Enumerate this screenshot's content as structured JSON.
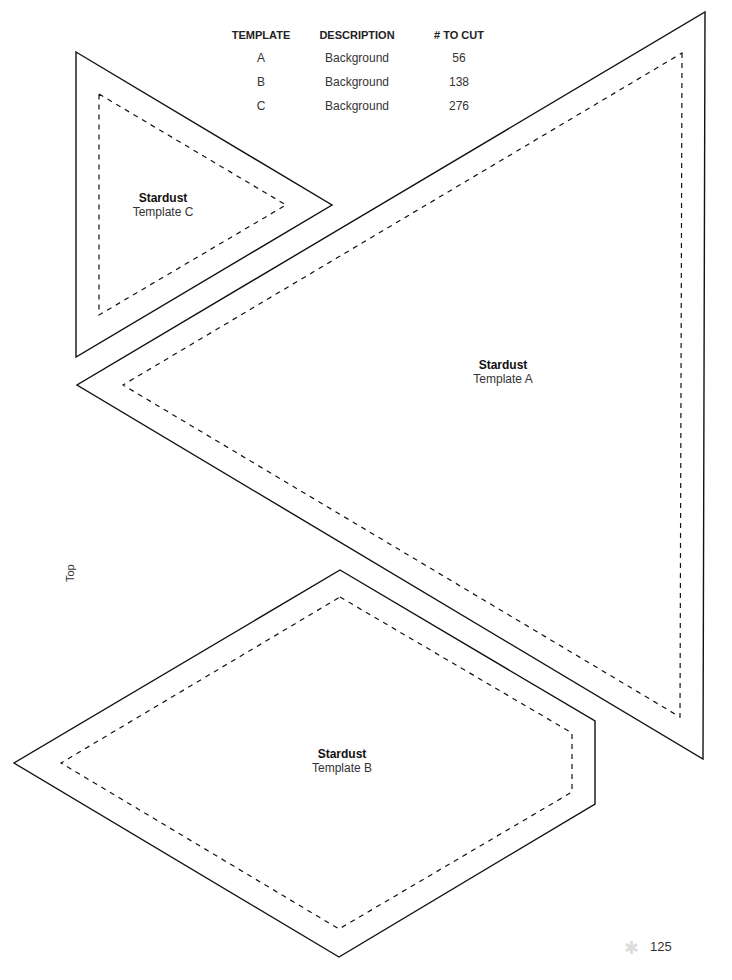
{
  "table": {
    "headers": [
      "TEMPLATE",
      "DESCRIPTION",
      "# TO CUT"
    ],
    "rows": [
      {
        "template": "A",
        "description": "Background",
        "count": "56"
      },
      {
        "template": "B",
        "description": "Background",
        "count": "138"
      },
      {
        "template": "C",
        "description": "Background",
        "count": "276"
      }
    ]
  },
  "templates": {
    "a": {
      "name": "Stardust",
      "label": "Template A"
    },
    "b": {
      "name": "Stardust",
      "label": "Template B"
    },
    "c": {
      "name": "Stardust",
      "label": "Template C"
    }
  },
  "orientation_label": "Top",
  "page": {
    "number": "125",
    "icon": "star-icon"
  }
}
